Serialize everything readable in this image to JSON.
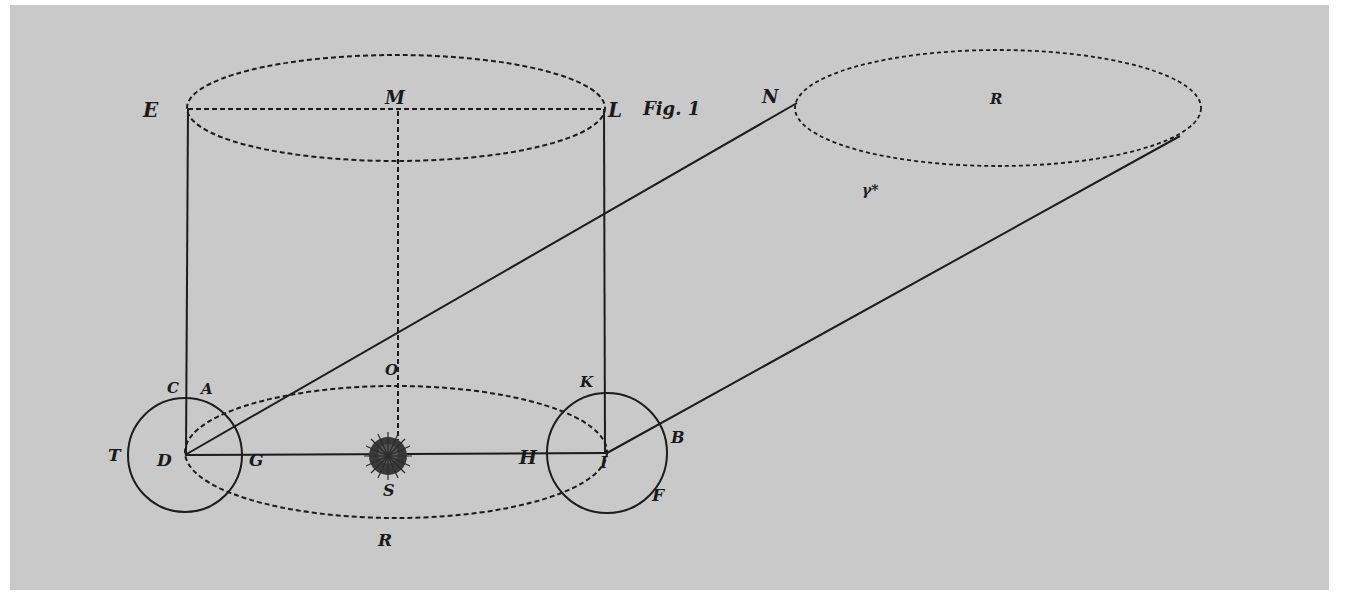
{
  "figure": {
    "caption": "Fig. 1",
    "background_color": "#c9c9c9",
    "ink_color": "#1c1c1c"
  },
  "labels": {
    "E": "E",
    "M": "M",
    "L": "L",
    "N": "N",
    "R_far": "R",
    "star": "γ*",
    "C": "C",
    "A": "A",
    "O": "O",
    "K": "K",
    "T": "T",
    "D": "D",
    "G": "G",
    "S": "S",
    "H": "H",
    "I": "I",
    "B": "B",
    "F": "F",
    "R_orbit": "R"
  },
  "shapes": {
    "sun": {
      "name": "sun",
      "cx": 388,
      "cy": 455,
      "r": 18
    },
    "earth_left": {
      "name": "circle-D",
      "cx": 185,
      "cy": 455,
      "r": 57
    },
    "earth_right": {
      "name": "circle-I",
      "cx": 607,
      "cy": 453,
      "r": 60
    },
    "orbit_ellipse": {
      "cx": 396,
      "cy": 452,
      "rx": 211,
      "ry": 66
    },
    "top_ellipse": {
      "cx": 396,
      "cy": 108,
      "rx": 209,
      "ry": 53
    },
    "far_ellipse": {
      "cx": 998,
      "cy": 108,
      "rx": 203,
      "ry": 58
    }
  }
}
